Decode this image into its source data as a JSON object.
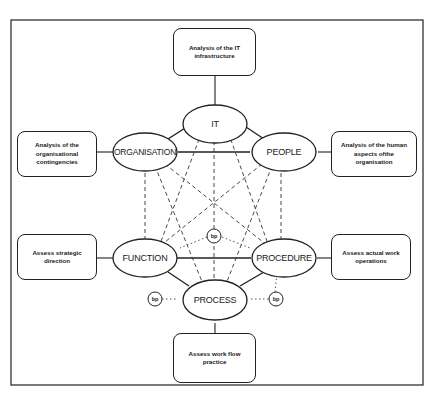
{
  "diagram": {
    "nodes": {
      "it": {
        "label": "IT"
      },
      "organisation": {
        "label": "ORGANISATION"
      },
      "people": {
        "label": "PEOPLE"
      },
      "function": {
        "label": "FUNCTION"
      },
      "procedure": {
        "label": "PROCEDURE"
      },
      "process": {
        "label": "PROCESS"
      }
    },
    "boxes": {
      "it_box": {
        "text": "Analysis of the IT infrastructure"
      },
      "organisation_box": {
        "text": "Analysis of the organisational contingencies"
      },
      "people_box": {
        "text": "Analysis of the human aspects ofthe organisation"
      },
      "function_box": {
        "text": "Assess strategic direction"
      },
      "procedure_box": {
        "text": "Assess actual work operations"
      },
      "process_box": {
        "text": "Assess work flow practice"
      }
    },
    "bp_markers": [
      {
        "label": "bp"
      },
      {
        "label": "bp"
      },
      {
        "label": "bp"
      }
    ],
    "colors": {
      "line": "#222222",
      "background": "#ffffff"
    }
  }
}
